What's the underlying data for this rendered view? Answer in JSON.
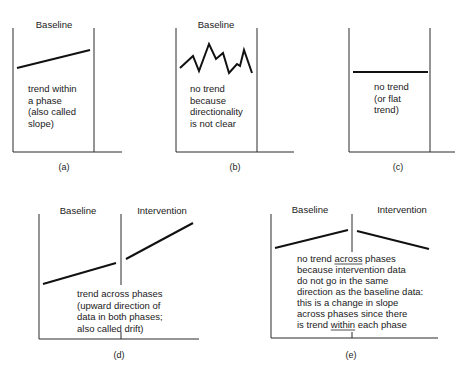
{
  "figure": {
    "panels": [
      {
        "id": "a",
        "caption": "(a)",
        "phases": [
          "Baseline"
        ],
        "description_lines": [
          "trend within",
          "a phase",
          "(also called",
          "slope)"
        ],
        "layout": {
          "left": 13,
          "top": 28,
          "bottom": 152,
          "right_end": 122,
          "divider": 94,
          "phase_label_x": [
            54
          ],
          "phase_label_y": 28,
          "text_x": 28,
          "text_y": 92,
          "line_h": 11.5,
          "caption_x": 64,
          "caption_y": 170
        },
        "series": [
          [
            [
              17,
              68
            ],
            [
              90,
              50
            ]
          ]
        ]
      },
      {
        "id": "b",
        "caption": "(b)",
        "phases": [
          "Baseline"
        ],
        "description_lines": [
          "no trend",
          "because",
          "directionality",
          "is not clear"
        ],
        "layout": {
          "left": 176,
          "top": 28,
          "bottom": 152,
          "right_end": 294,
          "divider": 257,
          "phase_label_x": [
            216
          ],
          "phase_label_y": 28,
          "text_x": 190,
          "text_y": 92,
          "line_h": 11.5,
          "caption_x": 235,
          "caption_y": 170
        },
        "series": [
          [
            [
              180,
              68
            ],
            [
              193,
              56
            ],
            [
              199,
              71
            ],
            [
              209,
              44
            ],
            [
              216,
              59
            ],
            [
              223,
              53
            ],
            [
              229,
              73
            ],
            [
              237,
              64
            ],
            [
              240,
              66
            ],
            [
              244,
              50
            ],
            [
              252,
              73
            ]
          ]
        ]
      },
      {
        "id": "c",
        "caption": "(c)",
        "phases": [],
        "description_lines": [
          "no trend",
          "(or flat",
          "trend)"
        ],
        "layout": {
          "left": 349,
          "top": 28,
          "bottom": 152,
          "right_end": 455,
          "divider": 430,
          "phase_label_x": [],
          "phase_label_y": 28,
          "text_x": 374,
          "text_y": 90,
          "line_h": 11.5,
          "caption_x": 398,
          "caption_y": 170
        },
        "series": [
          [
            [
              353,
              72
            ],
            [
              428,
              72
            ]
          ]
        ]
      },
      {
        "id": "d",
        "caption": "(d)",
        "phases": [
          "Baseline",
          "Intervention"
        ],
        "description_lines": [
          "trend across phases",
          "(upward direction of",
          "data in both phases;",
          "also called drift)"
        ],
        "layout": {
          "left": 39,
          "top": 214,
          "bottom": 339,
          "right_end": 199,
          "divider": 121,
          "divider_gap": [
            285,
            332
          ],
          "phase_label_x": [
            78,
            162
          ],
          "phase_label_y": 214,
          "text_x": 77,
          "text_y": 297,
          "line_h": 11.5,
          "caption_x": 119,
          "caption_y": 358
        },
        "series": [
          [
            [
              43,
              284
            ],
            [
              116,
              263
            ]
          ],
          [
            [
              126,
              259
            ],
            [
              193,
              223
            ]
          ]
        ]
      },
      {
        "id": "e",
        "caption": "(e)",
        "phases": [
          "Baseline",
          "Intervention"
        ],
        "description_lines": [
          "no trend across phases",
          "because intervention data",
          "do not go in the same",
          "direction as the baseline data:",
          "this is a change in slope",
          "across phases since there",
          "is trend within each phase"
        ],
        "underlined_words": [
          "across",
          "within"
        ],
        "layout": {
          "left": 271,
          "top": 214,
          "bottom": 338,
          "right_end": 438,
          "divider": 352,
          "divider_gap": [
            252,
            332
          ],
          "phase_label_x": [
            310,
            402
          ],
          "phase_label_y": 213,
          "text_x": 297,
          "text_y": 262,
          "line_h": 11,
          "caption_x": 351,
          "caption_y": 358
        },
        "series": [
          [
            [
              275,
              248
            ],
            [
              348,
              230
            ]
          ],
          [
            [
              357,
              231
            ],
            [
              429,
              249
            ]
          ]
        ]
      }
    ]
  }
}
